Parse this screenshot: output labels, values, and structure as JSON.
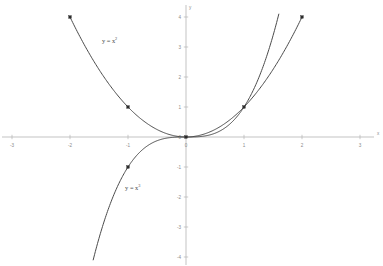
{
  "chart_data": {
    "type": "line",
    "title": "",
    "subtitle": "",
    "xlabel": "x",
    "ylabel": "y",
    "xlim": [
      -3,
      3
    ],
    "ylim": [
      -4,
      4
    ],
    "grid": false,
    "legend_position": "inline-annotations",
    "x_ticks": [
      -3,
      -2,
      -1,
      0,
      1,
      2,
      3
    ],
    "x_tick_labels": [
      "-3",
      "-2",
      "-1",
      "0",
      "1",
      "2",
      "3"
    ],
    "y_ticks": [
      -4,
      -3,
      -2,
      -1,
      0,
      1,
      2,
      3,
      4
    ],
    "y_tick_labels": [
      "-4",
      "-3",
      "-2",
      "-1",
      "0",
      "1",
      "2",
      "3",
      "4"
    ],
    "axis_color": "#b4b4b4",
    "curve_color": "#4a4a4a",
    "marker_color": "#2b2b2b",
    "background_color": "#ffffff",
    "series": [
      {
        "name": "y = x²",
        "expression": "x^2",
        "color": "#4a4a4a",
        "x": [
          -2,
          -1.75,
          -1.5,
          -1.25,
          -1,
          -0.75,
          -0.5,
          -0.25,
          0,
          0.25,
          0.5,
          0.75,
          1,
          1.25,
          1.5,
          1.75,
          2
        ],
        "values": [
          4,
          3.0625,
          2.25,
          1.5625,
          1,
          0.5625,
          0.25,
          0.0625,
          0,
          0.0625,
          0.25,
          0.5625,
          1,
          1.5625,
          2.25,
          3.0625,
          4
        ],
        "markers": [
          {
            "x": -2,
            "y": 4
          },
          {
            "x": -1,
            "y": 1
          },
          {
            "x": 0,
            "y": 0
          },
          {
            "x": 1,
            "y": 1
          },
          {
            "x": 2,
            "y": 4
          }
        ]
      },
      {
        "name": "y = x³",
        "expression": "x^3",
        "color": "#4a4a4a",
        "x": [
          -1.6,
          -1.4,
          -1.2,
          -1,
          -0.8,
          -0.6,
          -0.4,
          -0.2,
          0,
          0.2,
          0.4,
          0.6,
          0.8,
          1,
          1.2,
          1.4,
          1.6
        ],
        "values": [
          -4.096,
          -2.744,
          -1.728,
          -1,
          -0.512,
          -0.216,
          -0.064,
          -0.008,
          0,
          0.008,
          0.064,
          0.216,
          0.512,
          1,
          1.728,
          2.744,
          4.096
        ],
        "markers": [
          {
            "x": -1,
            "y": -1
          },
          {
            "x": 0,
            "y": 0
          },
          {
            "x": 1,
            "y": 1
          }
        ]
      }
    ],
    "annotations": [
      {
        "text": "y = x²",
        "base": "y = x",
        "exponent": "2",
        "x": -1.45,
        "y": 3.15
      },
      {
        "text": "y = x³",
        "base": "y = x",
        "exponent": "3",
        "x": -1.05,
        "y": -1.75
      }
    ]
  }
}
